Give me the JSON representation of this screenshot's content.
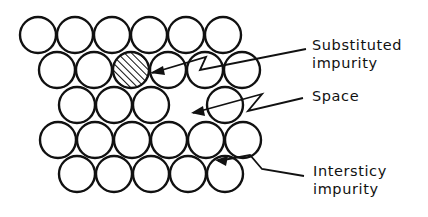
{
  "diagram": {
    "colors": {
      "stroke": "#111111",
      "background": "#ffffff"
    },
    "atom_radius": 18,
    "rows": [
      {
        "y": 35,
        "x": [
          38,
          75,
          112,
          149,
          186,
          223
        ]
      },
      {
        "y": 70,
        "x": [
          57,
          94,
          131,
          168,
          205,
          242
        ]
      },
      {
        "y": 105,
        "x": [
          77,
          114,
          151,
          225
        ]
      },
      {
        "y": 140,
        "x": [
          58,
          95,
          132,
          169,
          206,
          243
        ]
      },
      {
        "y": 174,
        "x": [
          77,
          114,
          151,
          188,
          225
        ]
      }
    ],
    "hatched_atom": {
      "row": 1,
      "x": 131,
      "y": 70
    },
    "vacancy": {
      "x": 188,
      "y": 105
    },
    "labels": {
      "substituted": {
        "line1": "Substituted",
        "line2": "impurity"
      },
      "space": {
        "line1": "Space"
      },
      "interstitial": {
        "line1": "Interstіcy",
        "line2": "impurity"
      }
    }
  }
}
